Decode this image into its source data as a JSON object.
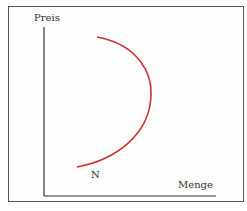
{
  "diagram": {
    "y_axis_label": "Preis",
    "x_axis_label": "Menge",
    "curve_label": "N",
    "curve_color": "#d0312d",
    "axis_color": "#333333",
    "curve_description": "backward-bending demand curve (N)"
  }
}
